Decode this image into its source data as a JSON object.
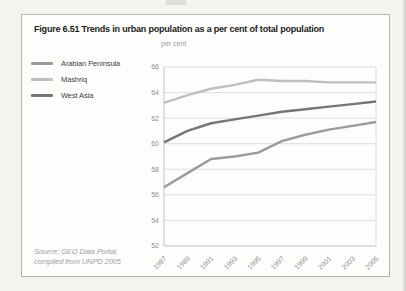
{
  "figure": {
    "title": "Figure 6.51 Trends in urban population as a per cent of total population",
    "axis_unit_label": "per cent",
    "source_line1": "Source: GEO Data Portal,",
    "source_line2": "compiled from UNPD 2005"
  },
  "colors": {
    "page_bg": "#f4f3f0",
    "panel_bg": "#fdfdfb",
    "panel_border": "#b8b4ad",
    "grid_line": "#dedede",
    "axis_line": "#c2c2c2",
    "tick_text": "#8f8f8f",
    "title_text": "#1b1b1b",
    "legend_text": "#3f3f3f",
    "source_text": "#9f9f9f"
  },
  "chart_data": {
    "type": "line",
    "title": "Trends in urban population as a per cent of total population",
    "ylabel": "per cent",
    "xlabel": "",
    "x": [
      "1987",
      "1989",
      "1991",
      "1993",
      "1995",
      "1997",
      "1999",
      "2001",
      "2003",
      "2005"
    ],
    "series": [
      {
        "name": "Arabian Peninsula",
        "color": "#9b9b9b",
        "values": [
          56.6,
          57.7,
          58.8,
          59.0,
          59.3,
          60.2,
          60.7,
          61.1,
          61.4,
          61.7
        ]
      },
      {
        "name": "Mashriq",
        "color": "#bfbfbf",
        "values": [
          63.2,
          63.8,
          64.3,
          64.6,
          65.0,
          64.9,
          64.9,
          64.8,
          64.8,
          64.8
        ]
      },
      {
        "name": "West Asia",
        "color": "#767676",
        "values": [
          60.1,
          61.0,
          61.6,
          61.9,
          62.2,
          62.5,
          62.7,
          62.9,
          63.1,
          63.3
        ]
      }
    ],
    "ylim": [
      52,
      66
    ],
    "ytick_step": 2,
    "grid": "horizontal",
    "legend_position": "left"
  }
}
